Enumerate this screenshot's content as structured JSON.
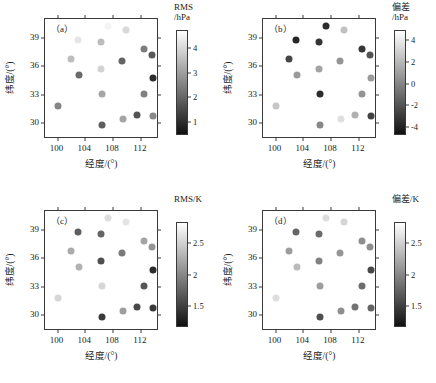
{
  "figure": {
    "axis": {
      "xlabel": "经度/(°)",
      "ylabel": "纬度/(°)",
      "xticks": [
        100,
        104,
        108,
        112
      ],
      "yticks": [
        30,
        33,
        36,
        39
      ],
      "xlim": [
        98.2,
        114.6
      ],
      "ylim": [
        28.3,
        41.0
      ]
    },
    "stations": [
      {
        "lon": 100.0,
        "lat": 31.8
      },
      {
        "lon": 102.0,
        "lat": 36.8
      },
      {
        "lon": 103.0,
        "lat": 38.8
      },
      {
        "lon": 103.1,
        "lat": 35.1
      },
      {
        "lon": 106.3,
        "lat": 38.6
      },
      {
        "lon": 106.3,
        "lat": 35.7
      },
      {
        "lon": 106.4,
        "lat": 33.1
      },
      {
        "lon": 106.4,
        "lat": 29.8
      },
      {
        "lon": 107.3,
        "lat": 40.3
      },
      {
        "lon": 109.3,
        "lat": 36.6
      },
      {
        "lon": 109.4,
        "lat": 30.4
      },
      {
        "lon": 109.9,
        "lat": 39.8
      },
      {
        "lon": 111.4,
        "lat": 30.8
      },
      {
        "lon": 112.4,
        "lat": 37.8
      },
      {
        "lon": 112.5,
        "lat": 33.1
      },
      {
        "lon": 113.6,
        "lat": 37.2
      },
      {
        "lon": 113.7,
        "lat": 34.8
      },
      {
        "lon": 113.7,
        "lat": 30.7
      }
    ],
    "panels": [
      {
        "id": "a",
        "tag": "（a）",
        "colorbar": {
          "title_line1": "RMS",
          "title_line2": "/hPa",
          "ticks": [
            1,
            2,
            3,
            4
          ],
          "vmin": 0.45,
          "vmax": 4.75,
          "top_color": "#ffffff",
          "bottom_color": "#111111"
        },
        "values": [
          2.55,
          3.55,
          4.3,
          2.05,
          3.55,
          3.95,
          3.15,
          1.85,
          4.55,
          1.95,
          3.1,
          4.05,
          1.65,
          2.4,
          2.45,
          1.75,
          0.95,
          2.6
        ]
      },
      {
        "id": "b",
        "tag": "（b）",
        "colorbar": {
          "title_line1": "偏差",
          "title_line2": "/hPa",
          "ticks": [
            -4,
            -2,
            0,
            2,
            4
          ],
          "vmin": -4.7,
          "vmax": 4.9,
          "top_color": "#ffffff",
          "bottom_color": "#111111"
        },
        "values": [
          2.6,
          -2.6,
          -3.9,
          0.8,
          -3.3,
          1.2,
          -3.6,
          0.1,
          -3.6,
          0.6,
          3.6,
          2.4,
          1.7,
          -3.2,
          0.6,
          -2.0,
          0.9,
          -2.7
        ]
      },
      {
        "id": "c",
        "tag": "（c）",
        "colorbar": {
          "title_line1": "RMS/K",
          "title_line2": "",
          "ticks": [
            1.5,
            2,
            2.5
          ],
          "vmin": 1.16,
          "vmax": 2.84,
          "top_color": "#ffffff",
          "bottom_color": "#111111"
        },
        "values": [
          2.55,
          2.25,
          1.7,
          2.3,
          1.75,
          1.6,
          2.55,
          1.45,
          2.6,
          1.9,
          2.15,
          2.65,
          1.55,
          2.2,
          1.65,
          2.1,
          1.35,
          1.45
        ]
      },
      {
        "id": "d",
        "tag": "（d）",
        "colorbar": {
          "title_line1": "偏差/K",
          "title_line2": "",
          "ticks": [
            1.5,
            2,
            2.5
          ],
          "vmin": 1.16,
          "vmax": 2.84,
          "top_color": "#ffffff",
          "bottom_color": "#111111"
        },
        "values": [
          2.6,
          2.15,
          1.75,
          2.35,
          1.8,
          1.95,
          2.15,
          1.6,
          2.6,
          2.1,
          2.05,
          2.55,
          1.85,
          2.05,
          1.8,
          2.05,
          1.55,
          1.75
        ]
      }
    ]
  },
  "chart_data": {
    "type": "scatter",
    "title": "",
    "xlabel": "经度/(°)",
    "ylabel": "纬度/(°)",
    "xlim": [
      98.2,
      114.6
    ],
    "ylim": [
      28.3,
      41.0
    ],
    "xticks": [
      100,
      104,
      108,
      112
    ],
    "yticks": [
      30,
      33,
      36,
      39
    ],
    "grid": false,
    "legend": "none",
    "colormap": "grayscale-reversed",
    "x": [
      100.0,
      102.0,
      103.0,
      103.1,
      106.3,
      106.3,
      106.4,
      106.4,
      107.3,
      109.3,
      109.4,
      109.9,
      111.4,
      112.4,
      112.5,
      113.6,
      113.7,
      113.7
    ],
    "y": [
      31.8,
      36.8,
      38.8,
      35.1,
      38.6,
      35.7,
      33.1,
      29.8,
      40.3,
      36.6,
      30.4,
      39.8,
      30.8,
      37.8,
      33.1,
      37.2,
      34.8,
      30.7
    ],
    "series": [
      {
        "name": "(a) RMS/hPa",
        "unit": "hPa",
        "clim": [
          0.45,
          4.75
        ],
        "cticks": [
          1,
          2,
          3,
          4
        ],
        "values": [
          2.55,
          3.55,
          4.3,
          2.05,
          3.55,
          3.95,
          3.15,
          1.85,
          4.55,
          1.95,
          3.1,
          4.05,
          1.65,
          2.4,
          2.45,
          1.75,
          0.95,
          2.6
        ]
      },
      {
        "name": "(b) 偏差/hPa",
        "unit": "hPa",
        "clim": [
          -4.7,
          4.9
        ],
        "cticks": [
          -4,
          -2,
          0,
          2,
          4
        ],
        "values": [
          2.6,
          -2.6,
          -3.9,
          0.8,
          -3.3,
          1.2,
          -3.6,
          0.1,
          -3.6,
          0.6,
          3.6,
          2.4,
          1.7,
          -3.2,
          0.6,
          -2.0,
          0.9,
          -2.7
        ]
      },
      {
        "name": "(c) RMS/K",
        "unit": "K",
        "clim": [
          1.16,
          2.84
        ],
        "cticks": [
          1.5,
          2,
          2.5
        ],
        "values": [
          2.55,
          2.25,
          1.7,
          2.3,
          1.75,
          1.6,
          2.55,
          1.45,
          2.6,
          1.9,
          2.15,
          2.65,
          1.55,
          2.2,
          1.65,
          2.1,
          1.35,
          1.45
        ]
      },
      {
        "name": "(d) 偏差/K",
        "unit": "K",
        "clim": [
          1.16,
          2.84
        ],
        "cticks": [
          1.5,
          2,
          2.5
        ],
        "values": [
          2.6,
          2.15,
          1.75,
          2.35,
          1.8,
          1.95,
          2.15,
          1.6,
          2.6,
          2.1,
          2.05,
          2.55,
          1.85,
          2.05,
          1.8,
          2.05,
          1.55,
          1.75
        ]
      }
    ]
  }
}
